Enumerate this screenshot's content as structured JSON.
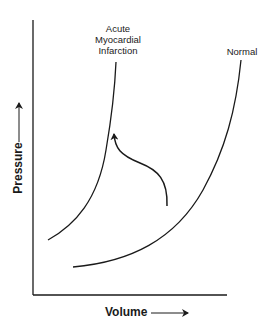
{
  "diagram": {
    "title": "",
    "x_axis": {
      "label": "Volume",
      "arrow": "right-arrow"
    },
    "y_axis": {
      "label": "Pressure",
      "arrow": "up-arrow"
    },
    "curves": [
      {
        "name": "ami-curve",
        "label_lines": [
          "Acute",
          "Myocardial",
          "Infarction"
        ],
        "description": "Steep pressure-volume curve"
      },
      {
        "name": "normal-curve",
        "label": "Normal",
        "description": "Compliant pressure-volume curve"
      }
    ],
    "shift_arrow": {
      "from": "Normal",
      "to": "Acute Myocardial Infarction",
      "description": "Curved arrow showing leftward/upward shift"
    },
    "colors": {
      "ink": "#1a1a1a",
      "background": "#ffffff"
    }
  }
}
